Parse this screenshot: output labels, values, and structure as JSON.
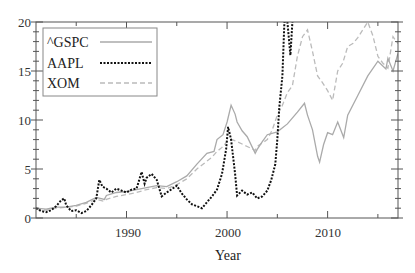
{
  "chart_data": {
    "type": "line",
    "title": "",
    "xlabel": "Year",
    "ylabel": "",
    "xlim": [
      1981,
      2017
    ],
    "ylim": [
      0,
      20
    ],
    "x_ticks": [
      1990,
      2000,
      2010
    ],
    "x_tick_labels": [
      "1990",
      "2000",
      "2010"
    ],
    "y_ticks": [
      0,
      5,
      10,
      15,
      20
    ],
    "y_tick_labels": [
      "0",
      "5",
      "10",
      "15",
      "20"
    ],
    "grid": false,
    "legend_position": "upper left",
    "series": [
      {
        "name": "^GSPC",
        "style": "solid",
        "color": "#aaaaaa",
        "x": [
          1981,
          1982,
          1983,
          1984,
          1985,
          1986,
          1987,
          1987.8,
          1988,
          1989,
          1990,
          1991,
          1992,
          1993,
          1994,
          1995,
          1996,
          1997,
          1998,
          1998.7,
          1999,
          1999.6,
          2000,
          2000.4,
          2000.8,
          2001,
          2001.5,
          2002,
          2002.8,
          2003,
          2003.5,
          2004,
          2005,
          2006,
          2007,
          2007.7,
          2008,
          2008.5,
          2009,
          2009.2,
          2009.6,
          2010,
          2010.5,
          2011,
          2011.6,
          2012,
          2013,
          2014,
          2015,
          2015.8,
          2016,
          2016.5,
          2017
        ],
        "values": [
          1.0,
          0.9,
          1.1,
          1.1,
          1.3,
          1.6,
          2.1,
          1.9,
          2.3,
          2.6,
          2.7,
          2.9,
          3.1,
          3.3,
          3.2,
          3.7,
          4.3,
          5.5,
          6.6,
          6.8,
          8.0,
          8.5,
          9.8,
          11.5,
          10.6,
          9.8,
          8.9,
          8.3,
          6.6,
          7.0,
          7.8,
          8.5,
          8.8,
          9.6,
          10.8,
          11.7,
          10.5,
          9.0,
          6.3,
          5.7,
          7.5,
          8.7,
          8.5,
          9.8,
          8.2,
          10.5,
          12.5,
          14.5,
          16.0,
          15.2,
          16.3,
          15.0,
          16.8
        ]
      },
      {
        "name": "AAPL",
        "style": "dotted",
        "color": "#111111",
        "x": [
          1981,
          1981.5,
          1982,
          1982.5,
          1983,
          1983.5,
          1983.8,
          1984,
          1984.5,
          1985,
          1985.5,
          1986,
          1986.5,
          1987,
          1987.3,
          1987.6,
          1988,
          1988.5,
          1989,
          1989.5,
          1990,
          1990.5,
          1991,
          1991.5,
          1991.8,
          1992,
          1992.5,
          1993,
          1993.5,
          1994,
          1995,
          1995.5,
          1996,
          1996.5,
          1997,
          1997.5,
          1998,
          1998.5,
          1999,
          1999.5,
          1999.9,
          2000.1,
          2000.4,
          2000.8,
          2001,
          2001.5,
          2002,
          2002.5,
          2003,
          2003.5,
          2004,
          2004.4,
          2004.8,
          2005,
          2005.2,
          2005.5,
          2005.7,
          2006,
          2006.3,
          2006.5
        ],
        "values": [
          1.0,
          0.7,
          0.6,
          0.8,
          1.2,
          1.8,
          2.0,
          1.3,
          0.7,
          0.8,
          0.5,
          0.7,
          1.3,
          2.0,
          3.9,
          3.2,
          3.0,
          2.6,
          3.0,
          2.8,
          2.6,
          2.9,
          3.0,
          4.7,
          3.5,
          4.1,
          4.5,
          3.9,
          2.2,
          2.6,
          3.3,
          2.5,
          1.9,
          1.4,
          1.2,
          1.0,
          1.6,
          2.2,
          2.9,
          4.5,
          7.0,
          9.3,
          8.0,
          4.5,
          2.3,
          2.8,
          2.4,
          2.6,
          2.0,
          2.2,
          2.8,
          3.9,
          5.5,
          8.0,
          11.3,
          14.5,
          20,
          20,
          16.6,
          20
        ]
      },
      {
        "name": "XOM",
        "style": "dashed",
        "color": "#bbbbbb",
        "x": [
          1981,
          1982,
          1983,
          1984,
          1985,
          1986,
          1987,
          1987.8,
          1988,
          1989,
          1990,
          1991,
          1992,
          1993,
          1994,
          1995,
          1996,
          1997,
          1998,
          1998.5,
          1999,
          1999.5,
          2000,
          2000.5,
          2001,
          2002,
          2002.8,
          2003,
          2004,
          2004.5,
          2005,
          2005.5,
          2006,
          2006.5,
          2007,
          2007.5,
          2008,
          2008.5,
          2009,
          2009.5,
          2010,
          2010.5,
          2011,
          2011.5,
          2012,
          2012.5,
          2013,
          2013.5,
          2014,
          2014.5,
          2015,
          2015.5,
          2016,
          2016.5,
          2017
        ],
        "values": [
          0.9,
          0.8,
          1.0,
          1.1,
          1.2,
          1.5,
          1.9,
          1.7,
          1.9,
          2.2,
          2.4,
          2.6,
          2.9,
          3.1,
          3.0,
          3.4,
          4.0,
          5.0,
          5.8,
          6.2,
          6.8,
          7.2,
          7.8,
          8.0,
          7.8,
          7.3,
          6.9,
          7.3,
          8.0,
          9.0,
          10.5,
          11.5,
          12.8,
          13.5,
          16.5,
          18.5,
          19.2,
          17.0,
          14.5,
          13.8,
          13.0,
          12.0,
          15.0,
          15.8,
          17.5,
          17.8,
          18.4,
          19.2,
          20.0,
          18.6,
          16.5,
          15.8,
          15.3,
          18.5,
          17.8
        ]
      }
    ]
  },
  "axes": {
    "xlabel": "Year",
    "x_tick_labels": [
      "1990",
      "2000",
      "2010"
    ],
    "y_tick_labels": [
      "0",
      "5",
      "10",
      "15",
      "20"
    ]
  },
  "legend": {
    "items": [
      {
        "label": "^GSPC",
        "style": "solid"
      },
      {
        "label": "AAPL",
        "style": "dotted"
      },
      {
        "label": "XOM",
        "style": "dashed"
      }
    ]
  }
}
